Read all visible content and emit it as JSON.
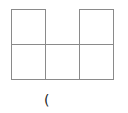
{
  "diagram": {
    "type": "grid-figure",
    "line_color": "#8a8a8a",
    "cells": [
      {
        "row": 0,
        "col": 0
      },
      {
        "row": 0,
        "col": 2
      },
      {
        "row": 1,
        "col": 0
      },
      {
        "row": 1,
        "col": 1
      },
      {
        "row": 1,
        "col": 2
      }
    ],
    "caption": "("
  }
}
